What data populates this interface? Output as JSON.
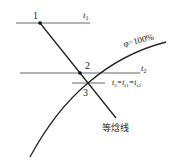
{
  "diagram": {
    "points": [
      {
        "id": "1",
        "label": "1"
      },
      {
        "id": "2",
        "label": "2"
      },
      {
        "id": "3",
        "label": "3"
      }
    ],
    "lines": {
      "t1": {
        "label_main": "t",
        "label_sub": "1"
      },
      "t2": {
        "label_main": "t",
        "label_sub": "2"
      },
      "t3": {
        "label": "t₃=t_s1=t_s2",
        "parts": [
          "t",
          "3",
          "=t",
          "s1",
          "=t",
          "s2"
        ]
      },
      "saturation_curve": {
        "label": "φ=100%"
      },
      "isenthalpic": {
        "label": "等焓线"
      }
    },
    "colors": {
      "line": "#222222",
      "gray_line": "#666666"
    }
  }
}
